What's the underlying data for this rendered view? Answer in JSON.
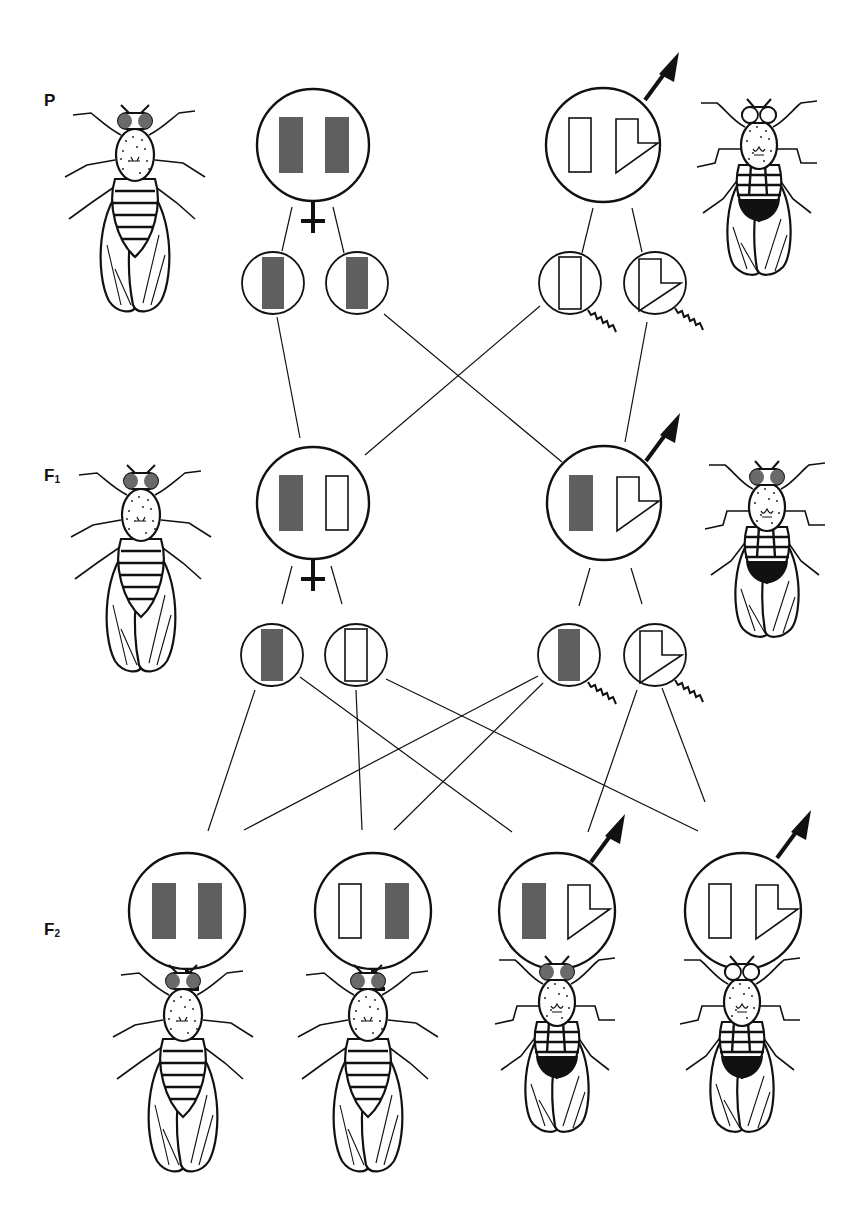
{
  "generations": [
    {
      "id": "P",
      "label": "P",
      "subscript": "",
      "y": 102
    },
    {
      "id": "F1",
      "label": "F",
      "subscript": "1",
      "y": 476
    },
    {
      "id": "F2",
      "label": "F",
      "subscript": "2",
      "y": 930
    }
  ],
  "colors": {
    "ink": "#111111",
    "wild_type_chromosome": "#5f5f5f",
    "red_eye_pigment": "#6a6a6a",
    "background": "#ffffff"
  },
  "legend_semantics": {
    "filled_rectangle": "X chromosome carrying dominant red-eye allele",
    "open_rectangle": "X chromosome carrying recessive white-eye allele",
    "hooked_shape": "Y chromosome",
    "venus_symbol": "female",
    "arrow_circle": "male",
    "wavy_tail": "sperm"
  },
  "p_generation": {
    "female": {
      "sex": "female",
      "genotype": [
        "X-red",
        "X-red"
      ],
      "eye": "red"
    },
    "male": {
      "sex": "male",
      "genotype": [
        "X-white",
        "Y"
      ],
      "eye": "white"
    },
    "female_gametes": [
      {
        "chromosome": "X-red",
        "type": "egg"
      },
      {
        "chromosome": "X-red",
        "type": "egg"
      }
    ],
    "male_gametes": [
      {
        "chromosome": "X-white",
        "type": "sperm"
      },
      {
        "chromosome": "Y",
        "type": "sperm"
      }
    ]
  },
  "f1_generation": {
    "female": {
      "sex": "female",
      "genotype": [
        "X-red",
        "X-white"
      ],
      "eye": "red"
    },
    "male": {
      "sex": "male",
      "genotype": [
        "X-red",
        "Y"
      ],
      "eye": "red"
    },
    "female_gametes": [
      {
        "chromosome": "X-red",
        "type": "egg"
      },
      {
        "chromosome": "X-white",
        "type": "egg"
      }
    ],
    "male_gametes": [
      {
        "chromosome": "X-red",
        "type": "sperm"
      },
      {
        "chromosome": "Y",
        "type": "sperm"
      }
    ]
  },
  "f2_generation": {
    "offspring": [
      {
        "sex": "female",
        "genotype": [
          "X-red",
          "X-red"
        ],
        "eye": "red"
      },
      {
        "sex": "female",
        "genotype": [
          "X-white",
          "X-red"
        ],
        "eye": "red"
      },
      {
        "sex": "male",
        "genotype": [
          "X-red",
          "Y"
        ],
        "eye": "red"
      },
      {
        "sex": "male",
        "genotype": [
          "X-white",
          "Y"
        ],
        "eye": "white"
      }
    ]
  },
  "caption": {
    "text": ""
  }
}
